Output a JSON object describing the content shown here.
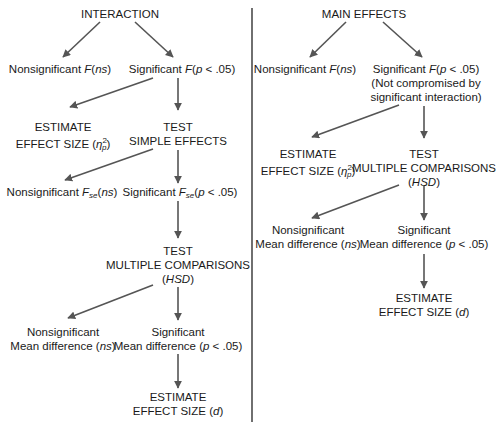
{
  "left": {
    "root": "INTERACTION",
    "nonsig_f": {
      "prefix": "Nonsignificant ",
      "f": "F",
      "paren": "(ns)"
    },
    "sig_f": {
      "prefix": "Significant ",
      "f": "F",
      "paren": "(p < .05)"
    },
    "estimate_eta": {
      "line1": "ESTIMATE",
      "line2": "EFFECT SIZE (",
      "symbol": "η",
      "sup": "2",
      "sub": "p",
      "close": ")"
    },
    "test_simple": {
      "line1": "TEST",
      "line2": "SIMPLE EFFECTS"
    },
    "nonsig_fse": {
      "prefix": "Nonsignificant ",
      "f": "F",
      "sub": "se",
      "paren": "(ns)"
    },
    "sig_fse": {
      "prefix": "Significant ",
      "f": "F",
      "sub": "se",
      "paren": "(p < .05)"
    },
    "test_multiple": {
      "line1": "TEST",
      "line2": "MULTIPLE COMPARISONS",
      "line3": "(HSD)"
    },
    "nonsig_mean": {
      "line1": "Nonsignificant",
      "line2": "Mean difference (ns)"
    },
    "sig_mean": {
      "line1": "Significant",
      "line2": "Mean difference (p < .05)"
    },
    "estimate_d": {
      "line1": "ESTIMATE",
      "line2": "EFFECT SIZE (d)"
    }
  },
  "right": {
    "root": "MAIN EFFECTS",
    "nonsig_f": {
      "prefix": "Nonsignificant ",
      "f": "F",
      "paren": "(ns)"
    },
    "sig_f": {
      "prefix": "Significant ",
      "f": "F",
      "paren": "(p < .05)",
      "line2": "(Not compromised by",
      "line3": "significant interaction)"
    },
    "estimate_eta": {
      "line1": "ESTIMATE",
      "line2": "EFFECT SIZE (",
      "symbol": "η",
      "sup": "2",
      "sub": "p",
      "close": ")"
    },
    "test_multiple": {
      "line1": "TEST",
      "line2": "MULTIPLE COMPARISONS",
      "line3": "(HSD)"
    },
    "nonsig_mean": {
      "line1": "Nonsignificant",
      "line2": "Mean difference (ns)"
    },
    "sig_mean": {
      "line1": "Significant",
      "line2": "Mean difference (p < .05)"
    },
    "estimate_d": {
      "line1": "ESTIMATE",
      "line2": "EFFECT SIZE (d)"
    }
  },
  "colors": {
    "arrow": "#555555",
    "divider": "#333333",
    "text": "#1a1a1a"
  }
}
